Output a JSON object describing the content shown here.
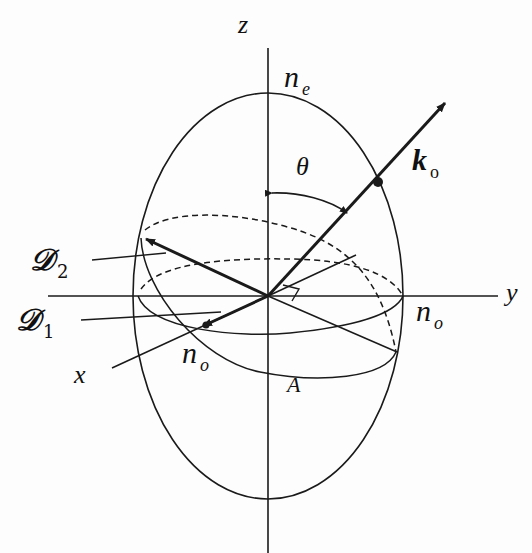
{
  "diagram": {
    "type": "index-ellipsoid",
    "labels": {
      "z_axis": "z",
      "y_axis": "y",
      "x_axis": "x",
      "ne": {
        "base": "n",
        "sub": "e"
      },
      "no_right": {
        "base": "n",
        "sub": "o"
      },
      "no_left": {
        "base": "n",
        "sub": "o"
      },
      "theta": "θ",
      "k": {
        "base": "k",
        "sub": "o"
      },
      "D2": {
        "base": "𝒟",
        "sub": "2"
      },
      "D1": {
        "base": "𝒟",
        "sub": "1"
      },
      "A": "A"
    },
    "colors": {
      "line": "#1a1a1a",
      "background": "#fdfdfd"
    }
  }
}
